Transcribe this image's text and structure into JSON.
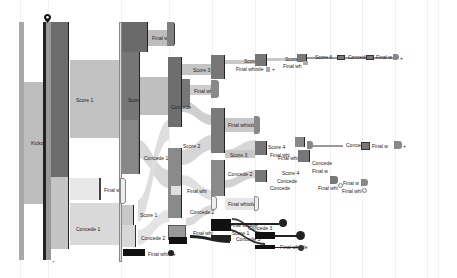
{
  "diagram": {
    "type": "sankey",
    "title": "",
    "gridlines_x": [
      20,
      48,
      121,
      169,
      212,
      255,
      295,
      330,
      362,
      395,
      427,
      438
    ],
    "colors": {
      "dark": "#5e5e5e",
      "mid": "#8a8a8a",
      "light": "#bdbdbd",
      "pale": "#dcdcdc",
      "black": "#111111",
      "link": "#c9c9c9",
      "link_light": "#e3e3e3"
    },
    "labels": {
      "kickoff": "Kickoff",
      "score1": "Score 1",
      "concede1": "Concede 1",
      "final_w_a": "Final w",
      "score2": "Score 2",
      "concede1b": "Concede 1",
      "final_w_b": "Final whistle",
      "score1b": "Score 1",
      "concede2": "Concede 2",
      "final_w_top": "Final wh",
      "score3": "Score 3",
      "final_w_c": "Final wh",
      "concede_mid": "Concede",
      "final_whistle_d": "Final whistle",
      "score2b": "Score 2",
      "final_whi_e": "Final whi",
      "concede2b": "Concede 2",
      "score3b": "Score 3",
      "final_whistle_f": "Final whistle",
      "score1c": "Score 1",
      "final_whi_g": "Final whi",
      "concede3": "Concede 3",
      "score4": "Score 4",
      "final_whistle_h": "Final whistle",
      "score5": "Score 5",
      "final_wh_i": "Final wh",
      "score6": "Score 6",
      "concede_j": "Concede",
      "final_w_k": "Final w",
      "score4b": "Score 4",
      "final_whistle_l": "Final whistle",
      "concede_m": "Concede",
      "final_w_n": "Final w",
      "score5b": "Score 5",
      "final_whi_o": "Final whi",
      "concede_p": "Concede",
      "final_w_q": "Final w",
      "score4c": "Score 4",
      "concede_r": "Concede",
      "final_w_s": "Final w",
      "final_whi_t": "Final whi",
      "final_whistle_u": "Final whistle",
      "score1d": "Score 1",
      "concede3b": "Concede 3",
      "final_whistle_v": "Final whistle",
      "final_whistle_w": "Final whistle",
      "final_whistle_x": "Final whistle",
      "plus": "+"
    }
  }
}
